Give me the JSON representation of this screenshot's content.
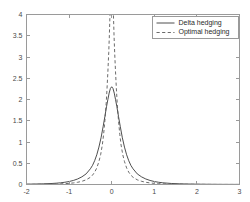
{
  "chart_data": {
    "type": "line",
    "title": "",
    "subtitle": "",
    "xlabel": "",
    "ylabel": "",
    "xlim": [
      -2,
      3
    ],
    "ylim": [
      0,
      4
    ],
    "grid": false,
    "legend_position": "top-right",
    "xticks": [
      "-2",
      "-1",
      "0",
      "1",
      "2",
      "3"
    ],
    "xtick_values": [
      -2,
      -1,
      0,
      1,
      2,
      3
    ],
    "yticks": [
      "0",
      "0.5",
      "1",
      "1.5",
      "2",
      "2.5",
      "3",
      "3.5",
      "4"
    ],
    "ytick_values": [
      0,
      0.5,
      1,
      1.5,
      2,
      2.5,
      3,
      3.5,
      4
    ],
    "series": [
      {
        "name": "Delta hedging",
        "style": "solid",
        "color": "#3a3a3a",
        "peak_x": 0.0,
        "peak_y": 2.3,
        "x": [
          -2.0,
          -1.8,
          -1.6,
          -1.4,
          -1.3,
          -1.2,
          -1.1,
          -1.0,
          -0.9,
          -0.8,
          -0.7,
          -0.6,
          -0.5,
          -0.45,
          -0.4,
          -0.35,
          -0.3,
          -0.25,
          -0.2,
          -0.16,
          -0.12,
          -0.09,
          -0.06,
          -0.03,
          0.0,
          0.03,
          0.06,
          0.09,
          0.12,
          0.16,
          0.2,
          0.25,
          0.3,
          0.35,
          0.4,
          0.45,
          0.5,
          0.6,
          0.7,
          0.8,
          0.9,
          1.0,
          1.1,
          1.2,
          1.4,
          1.6,
          1.8,
          2.0,
          2.3,
          2.6,
          3.0
        ],
        "y": [
          0.008,
          0.011,
          0.016,
          0.024,
          0.031,
          0.04,
          0.053,
          0.07,
          0.095,
          0.13,
          0.18,
          0.25,
          0.37,
          0.45,
          0.56,
          0.7,
          0.88,
          1.1,
          1.37,
          1.6,
          1.84,
          2.0,
          2.15,
          2.26,
          2.3,
          2.26,
          2.15,
          2.0,
          1.84,
          1.6,
          1.37,
          1.1,
          0.88,
          0.7,
          0.56,
          0.45,
          0.37,
          0.25,
          0.18,
          0.13,
          0.095,
          0.07,
          0.053,
          0.04,
          0.024,
          0.016,
          0.011,
          0.008,
          0.005,
          0.003,
          0.002
        ]
      },
      {
        "name": "Optimal hedging",
        "style": "dashed",
        "color": "#5a5a5a",
        "peak_x": 0.0,
        "peak_y": 4.0,
        "clipped_at_top": true,
        "x": [
          -2.0,
          -1.8,
          -1.6,
          -1.4,
          -1.2,
          -1.1,
          -1.0,
          -0.9,
          -0.8,
          -0.7,
          -0.6,
          -0.5,
          -0.45,
          -0.4,
          -0.35,
          -0.3,
          -0.26,
          -0.22,
          -0.19,
          -0.16,
          -0.13,
          -0.11,
          -0.09,
          -0.07,
          -0.055,
          -0.045,
          -0.04,
          0.0,
          0.04,
          0.045,
          0.055,
          0.07,
          0.09,
          0.11,
          0.13,
          0.16,
          0.19,
          0.22,
          0.26,
          0.3,
          0.35,
          0.4,
          0.45,
          0.5,
          0.6,
          0.7,
          0.8,
          0.9,
          1.0,
          1.1,
          1.2,
          1.4,
          1.6,
          1.8,
          2.0,
          2.3,
          2.6,
          3.0
        ],
        "y": [
          0.003,
          0.004,
          0.006,
          0.009,
          0.015,
          0.02,
          0.027,
          0.037,
          0.052,
          0.075,
          0.11,
          0.17,
          0.22,
          0.29,
          0.39,
          0.54,
          0.7,
          0.93,
          1.18,
          1.5,
          1.9,
          2.25,
          2.65,
          3.1,
          3.5,
          3.85,
          4.0,
          4.0,
          4.0,
          3.85,
          3.5,
          3.1,
          2.65,
          2.25,
          1.9,
          1.5,
          1.18,
          0.93,
          0.7,
          0.54,
          0.39,
          0.29,
          0.22,
          0.17,
          0.11,
          0.075,
          0.052,
          0.037,
          0.027,
          0.02,
          0.015,
          0.009,
          0.006,
          0.004,
          0.003,
          0.002,
          0.001,
          0.001
        ]
      }
    ],
    "legend": [
      {
        "label": "Delta hedging",
        "style": "solid"
      },
      {
        "label": "Optimal hedging",
        "style": "dashed"
      }
    ],
    "colors": {
      "axis": "#9a9a9a",
      "tick_text": "#4a4a4a",
      "series_solid": "#3a3a3a",
      "series_dashed": "#5a5a5a",
      "background": "#ffffff",
      "legend_border": "#9a9a9a"
    }
  }
}
